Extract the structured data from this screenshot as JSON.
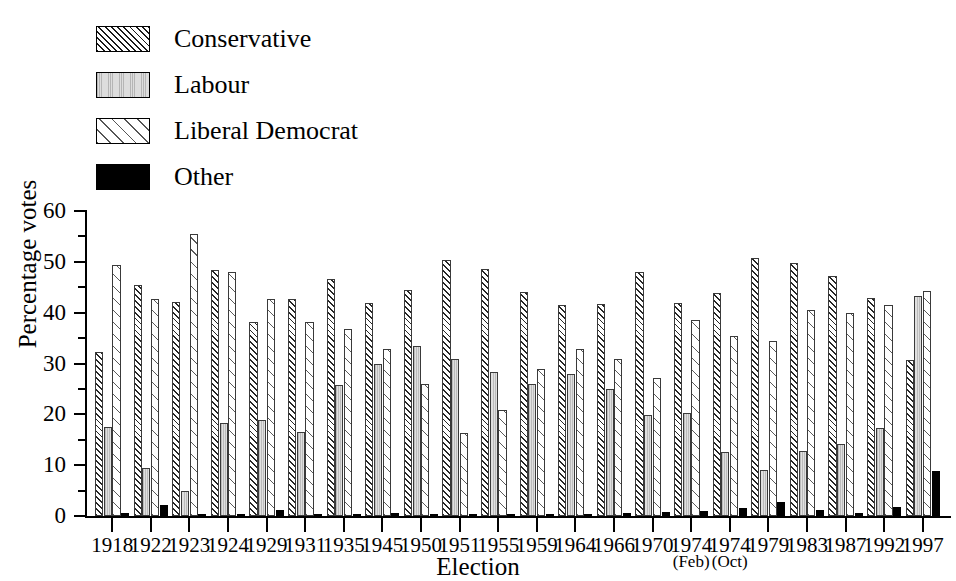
{
  "chart_data": {
    "type": "bar",
    "title": "",
    "xlabel": "Election",
    "ylabel": "Percentage votes",
    "ylim": [
      0,
      60
    ],
    "ytick_step": 10,
    "yminor_step": 5,
    "grid": false,
    "legend_position": "top-left",
    "ytick_labels": [
      "60",
      "50",
      "40",
      "30",
      "20",
      "10",
      "0"
    ],
    "categories": [
      "1918",
      "1922",
      "1923",
      "1924",
      "1929",
      "1931",
      "1935",
      "1945",
      "1950",
      "1951",
      "1955",
      "1959",
      "1964",
      "1966",
      "1970",
      "1974",
      "1974",
      "1979",
      "1983",
      "1987",
      "1992",
      "1997"
    ],
    "category_sublabels": [
      "",
      "",
      "",
      "",
      "",
      "",
      "",
      "",
      "",
      "",
      "",
      "",
      "",
      "",
      "",
      "(Feb)",
      "(Oct)",
      "",
      "",
      "",
      "",
      ""
    ],
    "series": [
      {
        "name": "Conservative",
        "key": "conservative",
        "values": [
          32.3,
          45.5,
          42.1,
          48.3,
          38.1,
          42.6,
          46.7,
          42.0,
          44.4,
          50.4,
          48.6,
          44.0,
          41.5,
          41.8,
          48.0,
          42.0,
          43.8,
          50.7,
          49.7,
          47.3,
          42.8,
          30.7
        ]
      },
      {
        "name": "Labour",
        "key": "labour",
        "values": [
          17.5,
          9.5,
          4.9,
          18.3,
          18.9,
          16.5,
          25.7,
          30.0,
          33.4,
          30.9,
          28.4,
          26.0,
          28.0,
          25.0,
          19.9,
          20.2,
          12.5,
          9.0,
          12.7,
          14.1,
          17.4,
          43.2
        ]
      },
      {
        "name": "Liberal Democrat",
        "key": "libdem",
        "values": [
          49.3,
          42.6,
          55.4,
          48.0,
          42.6,
          38.1,
          36.7,
          32.8,
          26.0,
          16.3,
          20.9,
          29.0,
          32.8,
          30.9,
          27.2,
          38.6,
          35.4,
          34.5,
          40.6,
          40.0,
          41.6,
          44.3
        ]
      },
      {
        "name": "Other",
        "key": "other",
        "values": [
          0.6,
          2.2,
          0.4,
          0.3,
          1.2,
          0.3,
          0.4,
          0.5,
          0.4,
          0.4,
          0.4,
          0.4,
          0.4,
          0.5,
          0.7,
          1.0,
          1.5,
          2.8,
          1.1,
          0.5,
          1.7,
          8.9
        ]
      }
    ]
  },
  "legend": {
    "items": [
      {
        "label": "Conservative",
        "key": "conservative",
        "swatch": "hatch-dense-45"
      },
      {
        "label": "Labour",
        "key": "labour",
        "swatch": "gray-vertical-fill"
      },
      {
        "label": "Liberal Democrat",
        "key": "libdem",
        "swatch": "hatch-sparse-45"
      },
      {
        "label": "Other",
        "key": "other",
        "swatch": "solid-black"
      }
    ]
  },
  "axes": {
    "y_title": "Percentage votes",
    "x_title": "Election"
  },
  "colors": {
    "hatch": "#262626",
    "labour_fill": "#d9d9d9",
    "other_fill": "#000000",
    "axis": "#000000",
    "background": "#ffffff"
  }
}
